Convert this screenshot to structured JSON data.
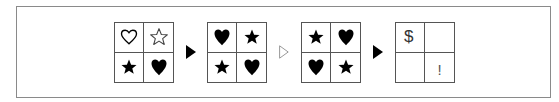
{
  "diagram": {
    "colors": {
      "frame": "#8a8a8a",
      "grid_line": "#555555",
      "symbol": "#000000",
      "hollow_arrow": "#999999"
    },
    "sequence": [
      {
        "type": "grid",
        "cells": [
          {
            "symbol": "heart-outline",
            "glyph": "♡"
          },
          {
            "symbol": "star-outline",
            "glyph": "☆"
          },
          {
            "symbol": "star-filled",
            "glyph": "★"
          },
          {
            "symbol": "heart-filled",
            "glyph": "♥"
          }
        ]
      },
      {
        "type": "arrow",
        "style": "filled"
      },
      {
        "type": "grid",
        "cells": [
          {
            "symbol": "heart-filled",
            "glyph": "♥"
          },
          {
            "symbol": "star-filled",
            "glyph": "★"
          },
          {
            "symbol": "star-filled",
            "glyph": "★"
          },
          {
            "symbol": "heart-filled",
            "glyph": "♥"
          }
        ]
      },
      {
        "type": "arrow",
        "style": "hollow"
      },
      {
        "type": "grid",
        "cells": [
          {
            "symbol": "star-filled",
            "glyph": "★"
          },
          {
            "symbol": "heart-filled",
            "glyph": "♥"
          },
          {
            "symbol": "heart-filled",
            "glyph": "♥"
          },
          {
            "symbol": "star-filled",
            "glyph": "★"
          }
        ]
      },
      {
        "type": "arrow",
        "style": "filled"
      },
      {
        "type": "grid",
        "cells": [
          {
            "symbol": "text",
            "glyph": "$"
          },
          {
            "symbol": "empty",
            "glyph": ""
          },
          {
            "symbol": "empty",
            "glyph": ""
          },
          {
            "symbol": "text",
            "glyph": "!"
          }
        ]
      }
    ]
  }
}
